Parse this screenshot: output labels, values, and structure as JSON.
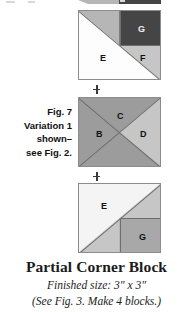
{
  "figure_note": {
    "lines": [
      "Fig. 7",
      "Variation 1",
      "shown–",
      "see Fig. 2."
    ]
  },
  "connectors": {
    "symbol": "+",
    "name": "plus-sign"
  },
  "caption": {
    "title": "Partial Corner Block",
    "finished_size": "Finished size: 3\" x 3\"",
    "note": "(See Fig. 3. Make 4 blocks.)"
  },
  "colors": {
    "white": "#fdfdfd",
    "near_white": "#f4f4f4",
    "light_gray": "#c6c6c6",
    "light_mid_gray": "#b6b6b6",
    "mid_gray": "#9c9c9c",
    "mid_dark_gray": "#a8a8a8",
    "dark_gray": "#454545",
    "outline": "#8c8c8c",
    "seam": "#6e6e6e",
    "text": "#101010"
  },
  "blocks": [
    {
      "id": "block-top",
      "name": "top-unit",
      "patches": [
        {
          "label": "",
          "name": "patch-upper-left-light",
          "fill": "#b6b6b6"
        },
        {
          "label": "E",
          "name": "patch-e",
          "fill": "#fdfdfd"
        },
        {
          "label": "F",
          "name": "patch-f",
          "fill": "#c6c6c6"
        },
        {
          "label": "G",
          "name": "patch-g",
          "fill": "#454545"
        }
      ]
    },
    {
      "id": "block-middle",
      "name": "middle-unit",
      "patches": [
        {
          "label": "C",
          "name": "patch-c",
          "fill": "#9c9c9c"
        },
        {
          "label": "B",
          "name": "patch-b",
          "fill": "#9c9c9c"
        },
        {
          "label": "D",
          "name": "patch-d",
          "fill": "#c6c6c6"
        },
        {
          "label": "",
          "name": "patch-bottom-triangle",
          "fill": "#9c9c9c"
        }
      ]
    },
    {
      "id": "block-bottom",
      "name": "bottom-unit",
      "patches": [
        {
          "label": "E",
          "name": "patch-e",
          "fill": "#f4f4f4"
        },
        {
          "label": "",
          "name": "patch-lower-left-light",
          "fill": "#c6c6c6"
        },
        {
          "label": "G",
          "name": "patch-g",
          "fill": "#a8a8a8"
        }
      ]
    }
  ]
}
